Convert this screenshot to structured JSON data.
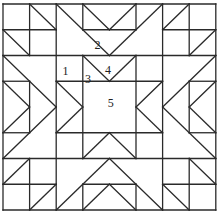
{
  "diagram": {
    "grid": {
      "cols": 8,
      "rows": 8,
      "x0": 3,
      "y0": 4,
      "x1": 215.8,
      "y1": 210
    },
    "stroke_color": "#2a2a2a",
    "background": "#ffffff",
    "labels": [
      {
        "text": "2",
        "gx": 3.55,
        "gy": 1.6
      },
      {
        "text": "1",
        "gx": 2.35,
        "gy": 2.6
      },
      {
        "text": "3",
        "gx": 3.2,
        "gy": 2.9
      },
      {
        "text": "4",
        "gx": 3.95,
        "gy": 2.55
      },
      {
        "text": "5",
        "gx": 4.05,
        "gy": 3.85
      }
    ],
    "lines": [
      [
        0,
        0,
        8,
        0
      ],
      [
        0,
        8,
        8,
        8
      ],
      [
        0,
        0,
        0,
        8
      ],
      [
        8,
        0,
        8,
        8
      ],
      [
        2,
        0,
        2,
        8
      ],
      [
        6,
        0,
        6,
        8
      ],
      [
        0,
        2,
        8,
        2
      ],
      [
        0,
        6,
        8,
        6
      ],
      [
        0,
        1,
        2,
        1
      ],
      [
        1,
        0,
        1,
        2
      ],
      [
        6,
        1,
        8,
        1
      ],
      [
        7,
        0,
        7,
        2
      ],
      [
        0,
        7,
        2,
        7
      ],
      [
        1,
        6,
        1,
        8
      ],
      [
        6,
        7,
        8,
        7
      ],
      [
        7,
        6,
        7,
        8
      ],
      [
        3,
        0,
        3,
        1
      ],
      [
        5,
        0,
        5,
        1
      ],
      [
        3,
        1,
        5,
        1
      ],
      [
        3,
        7,
        5,
        7
      ],
      [
        3,
        7,
        3,
        8
      ],
      [
        5,
        7,
        5,
        8
      ],
      [
        0,
        3,
        1,
        3
      ],
      [
        0,
        5,
        1,
        5
      ],
      [
        1,
        3,
        1,
        5
      ],
      [
        7,
        3,
        8,
        3
      ],
      [
        7,
        5,
        8,
        5
      ],
      [
        7,
        3,
        7,
        5
      ],
      [
        2,
        3,
        6,
        3
      ],
      [
        2,
        5,
        6,
        5
      ],
      [
        3,
        2,
        3,
        6
      ],
      [
        5,
        2,
        5,
        6
      ],
      [
        1,
        0,
        2,
        1
      ],
      [
        0,
        1,
        1,
        2
      ],
      [
        6,
        1,
        7,
        0
      ],
      [
        7,
        2,
        8,
        1
      ],
      [
        0,
        7,
        1,
        6
      ],
      [
        1,
        8,
        2,
        7
      ],
      [
        7,
        6,
        8,
        7
      ],
      [
        6,
        7,
        7,
        8
      ],
      [
        2,
        0,
        4,
        2
      ],
      [
        4,
        2,
        6,
        0
      ],
      [
        3,
        0,
        4,
        1
      ],
      [
        4,
        1,
        5,
        0
      ],
      [
        3,
        2,
        4,
        3
      ],
      [
        4,
        3,
        5,
        2
      ],
      [
        0,
        2,
        2,
        4
      ],
      [
        2,
        4,
        0,
        6
      ],
      [
        0,
        3,
        1,
        4
      ],
      [
        1,
        4,
        0,
        5
      ],
      [
        2,
        3,
        3,
        4
      ],
      [
        3,
        4,
        2,
        5
      ],
      [
        8,
        2,
        6,
        4
      ],
      [
        6,
        4,
        8,
        6
      ],
      [
        8,
        3,
        7,
        4
      ],
      [
        7,
        4,
        8,
        5
      ],
      [
        6,
        3,
        5,
        4
      ],
      [
        5,
        4,
        6,
        5
      ],
      [
        2,
        8,
        4,
        6
      ],
      [
        4,
        6,
        6,
        8
      ],
      [
        3,
        8,
        4,
        7
      ],
      [
        4,
        7,
        5,
        8
      ],
      [
        3,
        6,
        4,
        5
      ],
      [
        4,
        5,
        5,
        6
      ]
    ]
  }
}
